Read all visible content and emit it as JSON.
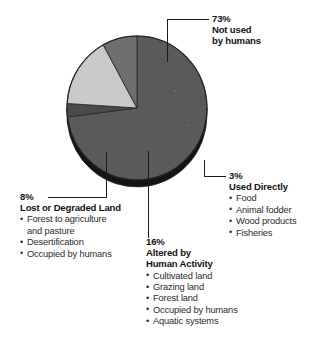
{
  "chart_data": {
    "type": "pie",
    "title": "",
    "categories": [
      "Not used by humans",
      "Used Directly",
      "Altered by Human Activity",
      "Lost or Degraded Land"
    ],
    "values": [
      73,
      3,
      16,
      8
    ],
    "unit": "%",
    "legend_position": "callouts",
    "colors": [
      "#5a5a5a",
      "#4a4a4a",
      "#c9c9c9",
      "#6e6e6e"
    ],
    "slices": [
      {
        "percent_label": "73%",
        "name": "Not used by humans",
        "value": 73,
        "color": "#5a5a5a"
      },
      {
        "percent_label": "3%",
        "name": "Used Directly",
        "value": 3,
        "color": "#4a4a4a"
      },
      {
        "percent_label": "16%",
        "name": "Altered by Human Activity",
        "value": 16,
        "color": "#c9c9c9"
      },
      {
        "percent_label": "8%",
        "name": "Lost or Degraded Land",
        "value": 8,
        "color": "#6e6e6e"
      }
    ]
  },
  "callouts": {
    "not_used": {
      "percent": "73%",
      "headline_line1": "Not used",
      "headline_line2": "by humans",
      "items": []
    },
    "used_directly": {
      "percent": "3%",
      "headline_line1": "Used Directly",
      "items": [
        "Food",
        "Animal fodder",
        "Wood products",
        "Fisheries"
      ]
    },
    "lost_or_degraded": {
      "percent": "8%",
      "headline_line1": "Lost or Degraded Land",
      "items": [
        "Forest to agriculture",
        "and pasture",
        "Desertification",
        "Occupied by humans"
      ],
      "continuation_indices": [
        1
      ]
    },
    "altered": {
      "percent": "16%",
      "headline_line1": "Altered by",
      "headline_line2": "Human Activity",
      "items": [
        "Cultivated land",
        "Grazing land",
        "Forest land",
        "Occupied by humans",
        "Aquatic systems"
      ]
    }
  }
}
